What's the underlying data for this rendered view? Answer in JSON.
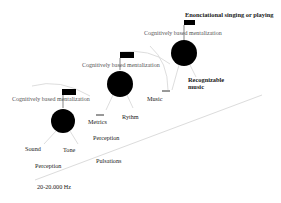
{
  "diagram": {
    "colors": {
      "node": "#000000",
      "label": "#1a1a1a",
      "faint_label": "#555555",
      "connector": "#d4d4d4",
      "axis": "#dcdcdc",
      "background": "#ffffff"
    },
    "levels": [
      {
        "id": "level-1",
        "mentalization_label": "Cognitively based mentalization",
        "branch_labels": [
          "Sound",
          "Tone"
        ],
        "sub_label": "Perception",
        "range_label": "20-20.000 Hz"
      },
      {
        "id": "level-2",
        "mentalization_label": "Cognitively based mentalization",
        "branch_labels": [
          "Metrics",
          "Rythm"
        ],
        "sub_label": "Perception",
        "extra_label": "Pulsations"
      },
      {
        "id": "level-3",
        "mentalization_label": "Cognitively based mentalization",
        "branch_labels": [
          "Music",
          "Recognizable music"
        ],
        "top_label": "Enonciational singing or playing"
      }
    ]
  }
}
